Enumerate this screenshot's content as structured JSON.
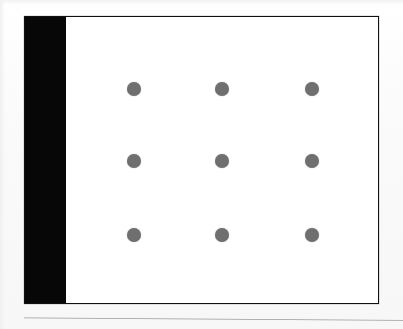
{
  "page": {
    "background_color": "#fbfbfb",
    "width": 403,
    "height": 329,
    "caption": ""
  },
  "figure": {
    "frame": {
      "border_color": "#111111",
      "fill_color": "#ffffff",
      "left": 24,
      "top": 16,
      "width": 355,
      "height": 288
    },
    "left_band": {
      "label": "",
      "color": "#070707",
      "width": 41
    },
    "bottom_rule": {
      "color": "#9a9a9a",
      "label": ""
    }
  },
  "chart_data": {
    "type": "scatter",
    "title": "",
    "subtitle": "",
    "xlabel": "",
    "ylabel": "",
    "grid": false,
    "legend": null,
    "legend_position": "none",
    "marker": {
      "shape": "circle",
      "color": "#6f6f6f",
      "size_px": 14
    },
    "xlim": [
      0,
      355
    ],
    "ylim": [
      0,
      288
    ],
    "xticklabels": [],
    "yticklabels": [],
    "series": [
      {
        "name": "dots",
        "color": "#6f6f6f",
        "points": [
          {
            "id": "r1c1",
            "x": 109,
            "y": 72
          },
          {
            "id": "r1c2",
            "x": 197,
            "y": 72
          },
          {
            "id": "r1c3",
            "x": 287,
            "y": 72
          },
          {
            "id": "r2c1",
            "x": 109,
            "y": 144
          },
          {
            "id": "r2c2",
            "x": 197,
            "y": 144
          },
          {
            "id": "r2c3",
            "x": 287,
            "y": 144
          },
          {
            "id": "r3c1",
            "x": 109,
            "y": 218
          },
          {
            "id": "r3c2",
            "x": 197,
            "y": 218
          },
          {
            "id": "r3c3",
            "x": 287,
            "y": 218
          }
        ]
      }
    ],
    "rows": 3,
    "columns": 3,
    "annotations": []
  }
}
